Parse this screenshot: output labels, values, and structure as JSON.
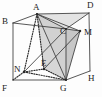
{
  "figure": {
    "type": "geometry-diagram",
    "background_color": "#fdfdfd",
    "stroke_color": "#3a3a3a",
    "hidden_stroke_color": "#2b2b2b",
    "shade_color": "#c9c9c9",
    "shade_color_light": "#dcdcdc",
    "label_color": "#1b1b1b",
    "labels": [
      {
        "id": "label-B",
        "text": "B",
        "x": 2,
        "y": 17
      },
      {
        "id": "label-A",
        "text": "A",
        "x": 33,
        "y": 3
      },
      {
        "id": "label-D",
        "text": "D",
        "x": 87,
        "y": 1
      },
      {
        "id": "label-C",
        "text": "C",
        "x": 60,
        "y": 27
      },
      {
        "id": "label-M",
        "text": "M",
        "x": 84,
        "y": 28
      },
      {
        "id": "label-N",
        "text": "N",
        "x": 14,
        "y": 65
      },
      {
        "id": "label-E",
        "text": "E",
        "x": 41,
        "y": 59
      },
      {
        "id": "label-F",
        "text": "F",
        "x": 2,
        "y": 84
      },
      {
        "id": "label-G",
        "text": "G",
        "x": 60,
        "y": 84
      },
      {
        "id": "label-H",
        "text": "H",
        "x": 88,
        "y": 74
      }
    ],
    "points": {
      "A": {
        "x": 37,
        "y": 14
      },
      "B": {
        "x": 13,
        "y": 23
      },
      "C": {
        "x": 66,
        "y": 29
      },
      "D": {
        "x": 89,
        "y": 13
      },
      "E": {
        "x": 44,
        "y": 69
      },
      "F": {
        "x": 13,
        "y": 80
      },
      "G": {
        "x": 66,
        "y": 80
      },
      "H": {
        "x": 90,
        "y": 71
      },
      "M": {
        "x": 80,
        "y": 31
      },
      "N": {
        "x": 24,
        "y": 72
      }
    },
    "edges": [
      {
        "id": "edge-BA",
        "from": "B",
        "to": "A",
        "style": "solid"
      },
      {
        "id": "edge-AD",
        "from": "A",
        "to": "D",
        "style": "solid"
      },
      {
        "id": "edge-BC",
        "from": "B",
        "to": "C",
        "style": "solid"
      },
      {
        "id": "edge-CD",
        "from": "C",
        "to": "D",
        "style": "solid"
      },
      {
        "id": "edge-BF",
        "from": "B",
        "to": "F",
        "style": "solid"
      },
      {
        "id": "edge-DH",
        "from": "D",
        "to": "H",
        "style": "solid"
      },
      {
        "id": "edge-CG",
        "from": "C",
        "to": "G",
        "style": "solid"
      },
      {
        "id": "edge-FG",
        "from": "F",
        "to": "G",
        "style": "solid"
      },
      {
        "id": "edge-GH",
        "from": "G",
        "to": "H",
        "style": "solid"
      },
      {
        "id": "edge-AC",
        "from": "A",
        "to": "C",
        "style": "solid"
      },
      {
        "id": "edge-AG",
        "from": "A",
        "to": "G",
        "style": "solid"
      },
      {
        "id": "edge-CM",
        "from": "C",
        "to": "M",
        "style": "solid"
      },
      {
        "id": "edge-MG",
        "from": "M",
        "to": "G",
        "style": "solid"
      },
      {
        "id": "edge-AM",
        "from": "A",
        "to": "M",
        "style": "solid"
      },
      {
        "id": "edge-CN",
        "from": "C",
        "to": "N",
        "style": "solid"
      },
      {
        "id": "edge-AN",
        "from": "A",
        "to": "N",
        "style": "dotted"
      },
      {
        "id": "edge-AE",
        "from": "A",
        "to": "E",
        "style": "dotted"
      },
      {
        "id": "edge-NE",
        "from": "N",
        "to": "E",
        "style": "dotted"
      },
      {
        "id": "edge-EG",
        "from": "E",
        "to": "G",
        "style": "dotted"
      },
      {
        "id": "edge-NG",
        "from": "N",
        "to": "G",
        "style": "dotted"
      },
      {
        "id": "edge-NF",
        "from": "N",
        "to": "F",
        "style": "dotted"
      },
      {
        "id": "edge-EM",
        "from": "E",
        "to": "M",
        "style": "solid"
      }
    ],
    "faces": [
      {
        "id": "face-ACG-shade",
        "points": "A,C,G",
        "fill": "#c9c9c9"
      },
      {
        "id": "face-ACM-shade",
        "points": "A,C,M",
        "fill": "#d4d4d4"
      },
      {
        "id": "face-CMG-shade",
        "points": "C,M,G",
        "fill": "#bdbdbd"
      },
      {
        "id": "face-top-shade",
        "points": "A,D,C",
        "fill": "#dedede"
      },
      {
        "id": "face-AEG-shade",
        "points": "A,E,G",
        "fill": "#d0d0d0"
      }
    ]
  }
}
